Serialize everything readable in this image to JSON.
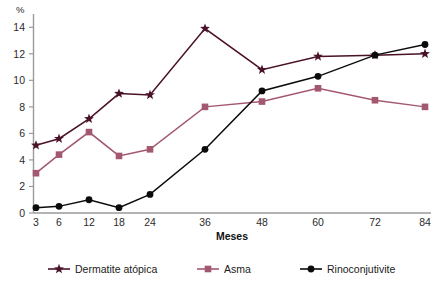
{
  "chart_data": {
    "type": "line",
    "title": "",
    "xlabel": "Meses",
    "ylabel": "%",
    "categories": [
      "3",
      "6",
      "12",
      "18",
      "24",
      "36",
      "48",
      "60",
      "72",
      "84"
    ],
    "x": [
      3,
      6,
      12,
      18,
      24,
      36,
      48,
      60,
      72,
      84
    ],
    "ylim": [
      0,
      15
    ],
    "yticks": [
      0,
      2,
      4,
      6,
      8,
      10,
      12,
      14
    ],
    "ytick_labels": [
      "0",
      "2",
      "4",
      "6",
      "8",
      "10",
      "12",
      "14"
    ],
    "xtick_labels": [
      "3",
      "6",
      "12",
      "18",
      "24",
      "36",
      "48",
      "60",
      "72",
      "84"
    ],
    "grid": false,
    "legend_position": "bottom",
    "series": [
      {
        "name": "Dermatite atópica",
        "marker": "star",
        "color": "#4a1228",
        "values": [
          5.1,
          5.6,
          7.1,
          9.0,
          8.9,
          13.9,
          10.8,
          11.8,
          11.9,
          12.0
        ]
      },
      {
        "name": "Asma",
        "marker": "square",
        "color": "#a4586f",
        "values": [
          3.0,
          4.4,
          6.1,
          4.3,
          4.8,
          8.0,
          8.4,
          9.4,
          8.5,
          8.0
        ]
      },
      {
        "name": "Rinoconjutivite",
        "marker": "circle",
        "color": "#0b0b0b",
        "values": [
          0.4,
          0.5,
          1.0,
          0.4,
          1.4,
          4.8,
          9.2,
          10.3,
          11.9,
          12.7
        ]
      }
    ]
  },
  "legend": {
    "items": [
      {
        "label": "Dermatite atópica",
        "marker": "star",
        "color": "#4a1228"
      },
      {
        "label": "Asma",
        "marker": "square",
        "color": "#a4586f"
      },
      {
        "label": "Rinoconjutivite",
        "marker": "circle",
        "color": "#0b0b0b"
      }
    ]
  },
  "axes": {
    "y_unit_label": "%",
    "x_title": "Meses"
  }
}
